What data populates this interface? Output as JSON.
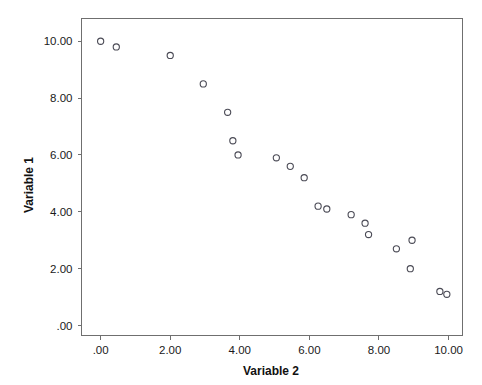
{
  "chart_data": {
    "type": "scatter",
    "title": "",
    "subtitle": "",
    "xlabel": "Variable 2",
    "ylabel": "Variable 1",
    "xlim": [
      -0.55,
      10.4
    ],
    "ylim": [
      -0.35,
      10.8
    ],
    "grid": false,
    "legend": null,
    "legend_position": "none",
    "marker": "open-circle",
    "marker_color": "#4a4a55",
    "background_color": "#ffffff",
    "frame_color": "#6f6f6f",
    "x_ticks": [
      {
        "value": 0,
        "label": ".00"
      },
      {
        "value": 2,
        "label": "2.00"
      },
      {
        "value": 4,
        "label": "4.00"
      },
      {
        "value": 6,
        "label": "6.00"
      },
      {
        "value": 8,
        "label": "8.00"
      },
      {
        "value": 10,
        "label": "10.00"
      }
    ],
    "y_ticks": [
      {
        "value": 0,
        "label": ".00"
      },
      {
        "value": 2,
        "label": "2.00"
      },
      {
        "value": 4,
        "label": "4.00"
      },
      {
        "value": 6,
        "label": "6.00"
      },
      {
        "value": 8,
        "label": "8.00"
      },
      {
        "value": 10,
        "label": "10.00"
      }
    ],
    "series": [
      {
        "name": "Variable 1 vs Variable 2",
        "points": [
          {
            "x": 0.0,
            "y": 10.0
          },
          {
            "x": 0.45,
            "y": 9.8
          },
          {
            "x": 2.0,
            "y": 9.5
          },
          {
            "x": 2.95,
            "y": 8.5
          },
          {
            "x": 3.65,
            "y": 7.5
          },
          {
            "x": 3.8,
            "y": 6.5
          },
          {
            "x": 3.95,
            "y": 6.0
          },
          {
            "x": 5.05,
            "y": 5.9
          },
          {
            "x": 5.45,
            "y": 5.6
          },
          {
            "x": 5.85,
            "y": 5.2
          },
          {
            "x": 6.25,
            "y": 4.2
          },
          {
            "x": 6.5,
            "y": 4.1
          },
          {
            "x": 7.2,
            "y": 3.9
          },
          {
            "x": 7.6,
            "y": 3.6
          },
          {
            "x": 7.7,
            "y": 3.2
          },
          {
            "x": 8.5,
            "y": 2.7
          },
          {
            "x": 8.95,
            "y": 3.0
          },
          {
            "x": 8.9,
            "y": 2.0
          },
          {
            "x": 9.75,
            "y": 1.2
          },
          {
            "x": 9.95,
            "y": 1.1
          }
        ]
      }
    ]
  }
}
